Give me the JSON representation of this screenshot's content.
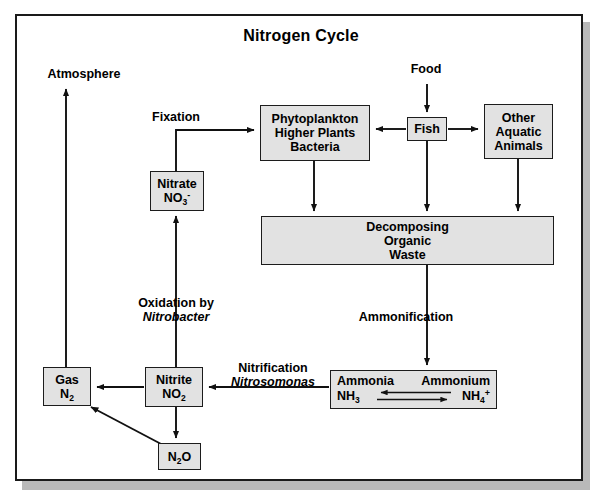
{
  "diagram": {
    "title": "Nitrogen Cycle",
    "type": "flow-diagram",
    "palette": {
      "box_fill": "#e2e2e2",
      "box_stroke": "#1c1c1c",
      "frame_stroke": "#1a1a1a",
      "shadow": "#b9b9b9",
      "background": "#ffffff",
      "text": "#000000"
    },
    "nodes": {
      "phytoplankton": {
        "line1": "Phytoplankton",
        "line2": "Higher Plants",
        "line3": "Bacteria"
      },
      "fish": {
        "line1": "Fish"
      },
      "other_aquatic": {
        "line1": "Other",
        "line2": "Aquatic",
        "line3": "Animals"
      },
      "nitrate": {
        "line1": "Nitrate",
        "name": "NO",
        "sub": "3",
        "sup": "-"
      },
      "decomposing": {
        "line1": "Decomposing",
        "line2": "Organic",
        "line3": "Waste"
      },
      "gas": {
        "line1": "Gas",
        "name": "N",
        "sub": "2"
      },
      "nitrite": {
        "line1": "Nitrite",
        "name": "NO",
        "sub": "2"
      },
      "nitrous_oxide": {
        "n1": "N",
        "sub1": "2",
        "n2": "O"
      },
      "ammonia_box": {
        "ammonia_label": "Ammonia",
        "ammonium_label": "Ammonium",
        "ammonia_formula_a": "NH",
        "ammonia_formula_sub": "3",
        "ammonium_formula_a": "NH",
        "ammonium_formula_sub": "4",
        "ammonium_formula_sup": "+"
      }
    },
    "labels": {
      "atmosphere": "Atmosphere",
      "food": "Food",
      "fixation": "Fixation",
      "oxidation_line1": "Oxidation by",
      "oxidation_line2": "Nitrobacter",
      "ammonification": "Ammonification",
      "nitrification_line1": "Nitrification",
      "nitrification_line2": "Nitrosomonas"
    },
    "edges": [
      {
        "from": "gas",
        "to": "atmosphere",
        "label": ""
      },
      {
        "from": "nitrate",
        "to": "phytoplankton",
        "label": "Fixation"
      },
      {
        "from": "food",
        "to": "fish",
        "label": ""
      },
      {
        "from": "fish",
        "to": "phytoplankton",
        "label": ""
      },
      {
        "from": "fish",
        "to": "other_aquatic",
        "label": ""
      },
      {
        "from": "phytoplankton",
        "to": "decomposing",
        "label": ""
      },
      {
        "from": "fish",
        "to": "decomposing",
        "label": ""
      },
      {
        "from": "other_aquatic",
        "to": "decomposing",
        "label": ""
      },
      {
        "from": "decomposing",
        "to": "ammonia_box",
        "label": "Ammonification"
      },
      {
        "from": "ammonia_box",
        "to": "nitrite",
        "label": "Nitrification / Nitrosomonas"
      },
      {
        "from": "nitrite",
        "to": "nitrate",
        "label": "Oxidation by Nitrobacter"
      },
      {
        "from": "nitrite",
        "to": "gas",
        "label": ""
      },
      {
        "from": "nitrite",
        "to": "nitrous_oxide",
        "label": ""
      },
      {
        "from": "nitrous_oxide",
        "to": "gas",
        "label": ""
      },
      {
        "from": "ammonia_box",
        "to": "ammonia_box",
        "label": "NH3 <-> NH4+ equilibrium"
      }
    ]
  }
}
